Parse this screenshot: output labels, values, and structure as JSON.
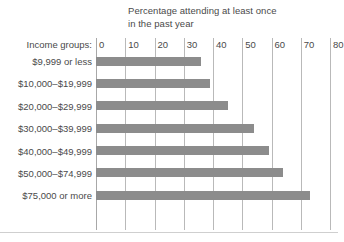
{
  "chart_data": {
    "type": "bar",
    "orientation": "horizontal",
    "title": "Percentage attending at least once\nin the past year",
    "xlabel": "",
    "ylabel": "Income groups:",
    "categories": [
      "$9,999 or less",
      "$10,000–$19,999",
      "$20,000–$29,999",
      "$30,000–$39,999",
      "$40,000–$49,999",
      "$50,000–$74,999",
      "$75,000 or more"
    ],
    "values": [
      36,
      39,
      45,
      54,
      59,
      64,
      73
    ],
    "xlim": [
      0,
      80
    ],
    "xticks": [
      0,
      10,
      20,
      30,
      40,
      50,
      60,
      70,
      80
    ],
    "xtick_labels": [
      "0",
      "10",
      "20",
      "30",
      "40",
      "50",
      "60",
      "70",
      "80"
    ],
    "grid": true,
    "legend": false,
    "bar_color": "#8c8c8c",
    "gridline_color": "#b9b9b9",
    "text_color": "#4a4a4a"
  }
}
